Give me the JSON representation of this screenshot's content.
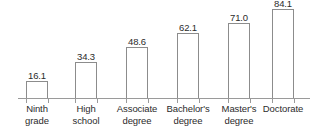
{
  "chart_data": {
    "type": "bar",
    "title": "",
    "subtitle": "",
    "xlabel": "",
    "ylabel": "",
    "ylim": [
      0,
      92
    ],
    "grid": false,
    "legend": false,
    "axis": {
      "y_axis_visible": false,
      "x_axis_visible": true,
      "tick_marks": true
    },
    "categories": [
      "Ninth grade",
      "High school",
      "Associate degree",
      "Bachelor's degree",
      "Master's degree",
      "Doctorate"
    ],
    "category_lines": [
      [
        "Ninth",
        "grade"
      ],
      [
        "High",
        "school"
      ],
      [
        "Associate",
        "degree"
      ],
      [
        "Bachelor's",
        "degree"
      ],
      [
        "Master's",
        "degree"
      ],
      [
        "Doctorate",
        ""
      ]
    ],
    "values": [
      16.1,
      34.3,
      48.6,
      62.1,
      71.0,
      84.1
    ],
    "value_labels": [
      "16.1",
      "34.3",
      "48.6",
      "62.1",
      "71.0",
      "84.1"
    ],
    "colors": {
      "bar_fill": "#ffffff",
      "bar_stroke": "#8c8c8c",
      "axis": "#9a9a9a",
      "text": "#2b2b2b",
      "background": "#ffffff"
    }
  }
}
